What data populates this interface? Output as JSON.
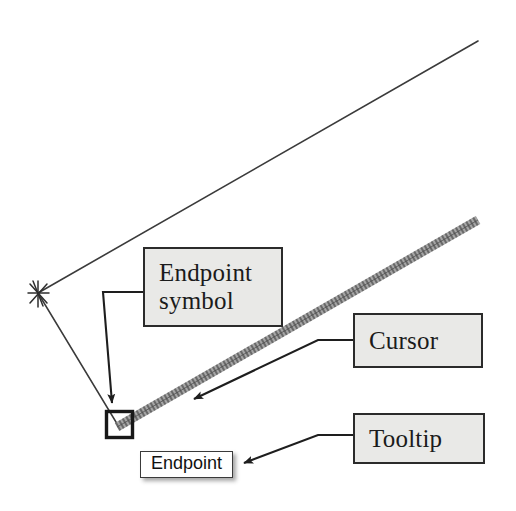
{
  "scene": {
    "title": "Endpoint object snap illustration",
    "background_color": "#ffffff",
    "ink_color": "#2b2b2b"
  },
  "callouts": [
    {
      "id": "endpoint-symbol",
      "label": "Endpoint\nsymbol",
      "fill_color": "#e9e9e7",
      "border_color": "#2b2b2b"
    },
    {
      "id": "cursor",
      "label": "Cursor",
      "fill_color": "#e9e9e7",
      "border_color": "#2b2b2b"
    },
    {
      "id": "tooltip",
      "label": "Tooltip",
      "fill_color": "#e9e9e7",
      "border_color": "#2b2b2b"
    }
  ],
  "tooltip": {
    "label": "Endpoint",
    "fill_color": "#ffffff",
    "border_color": "#3a3a3a"
  },
  "drawing": {
    "endpoint_marker": {
      "name": "endpoint-square-marker",
      "shape": "square",
      "x": 106,
      "y": 411,
      "size": 27
    },
    "snap_vertex_marker": {
      "name": "vertex-asterisk-marker",
      "shape": "asterisk",
      "x": 38,
      "y": 293
    },
    "cursor_line": {
      "name": "cursor-rubber-band-line",
      "from": [
        118,
        426
      ],
      "to": [
        478,
        220
      ],
      "style": "thick-textured"
    },
    "geometry_lines": [
      {
        "name": "upper-edge-line",
        "from": [
          38,
          293
        ],
        "to": [
          478,
          41
        ],
        "style": "thin-dashed"
      },
      {
        "name": "lower-edge-line",
        "from": [
          38,
          293
        ],
        "to": [
          118,
          426
        ],
        "style": "thin-dashed"
      }
    ],
    "leaders": [
      {
        "name": "leader-endpoint-symbol",
        "points": "143,292 103,292 113,404",
        "arrow_at": [
          113,
          412
        ]
      },
      {
        "name": "leader-cursor",
        "points": "353,340 318,340 193,399",
        "arrow_at": [
          186,
          403
        ]
      },
      {
        "name": "leader-tooltip",
        "points": "353,435 318,435 243,463",
        "arrow_at": [
          235,
          466
        ]
      }
    ]
  }
}
